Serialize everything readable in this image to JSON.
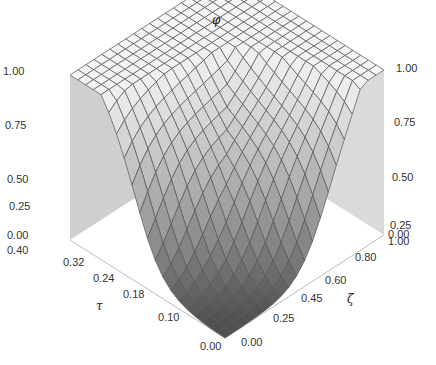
{
  "chart_data": {
    "type": "surface3d",
    "title": "",
    "axes": {
      "x": {
        "name": "tau",
        "label": "τ",
        "ticks": [
          "0.00",
          "0.10",
          "0.18",
          "0.24",
          "0.32",
          "0.40"
        ],
        "range": [
          0.0,
          0.4
        ]
      },
      "y": {
        "name": "zeta",
        "label": "ζ",
        "ticks": [
          "0.00",
          "0.25",
          "0.45",
          "0.60",
          "0.80",
          "1.00"
        ],
        "range": [
          0.0,
          1.0
        ]
      },
      "z": {
        "name": "phi",
        "label": "φ",
        "ticks": [
          "0.00",
          "0.25",
          "0.50",
          "0.75",
          "1.00"
        ],
        "range": [
          0.0,
          1.0
        ]
      }
    },
    "z_ticks_left": [
      "1.00",
      "0.75",
      "0.50",
      "0.25",
      "0.00"
    ],
    "z_ticks_right": [
      "1.00",
      "0.75",
      "0.50",
      "0.25",
      "0.00"
    ],
    "grid_resolution": 20,
    "surface_description": "φ near 0 for small τ and small ζ (front floor region), rising steeply to ~1 as τ or ζ increase; φ≈0.72 at τ=0.40, ζ=0; φ≈1.0 at τ=0.40, ζ=1.0; φ≈0.95 at τ=0, ζ=1.0",
    "sample_points": [
      {
        "tau": 0.0,
        "zeta": 0.0,
        "phi": 0.0
      },
      {
        "tau": 0.18,
        "zeta": 0.0,
        "phi": 0.02
      },
      {
        "tau": 0.4,
        "zeta": 0.0,
        "phi": 0.72
      },
      {
        "tau": 0.0,
        "zeta": 0.8,
        "phi": 0.02
      },
      {
        "tau": 0.0,
        "zeta": 1.0,
        "phi": 0.95
      },
      {
        "tau": 0.4,
        "zeta": 1.0,
        "phi": 1.0
      },
      {
        "tau": 0.24,
        "zeta": 0.45,
        "phi": 0.4
      }
    ],
    "colors": {
      "surface_light": "#f2f2f2",
      "surface_dark": "#5a5a5a",
      "mesh": "#555555",
      "wall": "#cfcfcf",
      "axis": "#bbbbbb"
    }
  }
}
